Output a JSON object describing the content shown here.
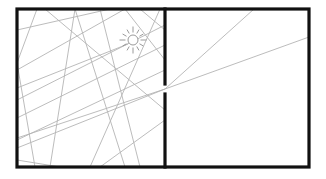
{
  "diagram": {
    "colors": {
      "wall": "#111111",
      "ray": "#b4b4b4",
      "sun": "#9a9a9a",
      "background": "#ffffff"
    },
    "frame": {
      "x1": 17,
      "y1": 9,
      "x2": 309,
      "y2": 167
    },
    "divider": {
      "x": 165,
      "top_segment_end_y": 84,
      "bottom_segment_start_y": 94
    },
    "light_source": {
      "icon": "sun-icon",
      "cx": 133,
      "cy": 40,
      "r": 5,
      "ray_inner": 7.5,
      "ray_outer": 12,
      "ray_count": 12
    },
    "rays_left_room": [
      {
        "x1": 37,
        "y1": 9,
        "x2": 17,
        "y2": 63
      },
      {
        "x1": 17,
        "y1": 63,
        "x2": 35,
        "y2": 167
      },
      {
        "x1": 75,
        "y1": 9,
        "x2": 50,
        "y2": 167
      },
      {
        "x1": 75,
        "y1": 9,
        "x2": 125,
        "y2": 167
      },
      {
        "x1": 17,
        "y1": 118,
        "x2": 165,
        "y2": 45
      },
      {
        "x1": 17,
        "y1": 140,
        "x2": 165,
        "y2": 70
      },
      {
        "x1": 17,
        "y1": 70,
        "x2": 125,
        "y2": 9
      },
      {
        "x1": 125,
        "y1": 9,
        "x2": 165,
        "y2": 60
      },
      {
        "x1": 17,
        "y1": 100,
        "x2": 165,
        "y2": 25
      },
      {
        "x1": 17,
        "y1": 160,
        "x2": 60,
        "y2": 167
      },
      {
        "x1": 110,
        "y1": 9,
        "x2": 17,
        "y2": 30
      },
      {
        "x1": 100,
        "y1": 9,
        "x2": 140,
        "y2": 167
      },
      {
        "x1": 160,
        "y1": 9,
        "x2": 90,
        "y2": 167
      },
      {
        "x1": 128,
        "y1": 44,
        "x2": 17,
        "y2": 88
      },
      {
        "x1": 140,
        "y1": 9,
        "x2": 165,
        "y2": 30
      },
      {
        "x1": 165,
        "y1": 120,
        "x2": 100,
        "y2": 167
      },
      {
        "x1": 45,
        "y1": 9,
        "x2": 165,
        "y2": 110
      }
    ],
    "rays_through_gap": [
      {
        "x1": 17,
        "y1": 148,
        "x2": 165,
        "y2": 89
      },
      {
        "x1": 165,
        "y1": 89,
        "x2": 254,
        "y2": 9
      },
      {
        "x1": 17,
        "y1": 138,
        "x2": 165,
        "y2": 89
      },
      {
        "x1": 165,
        "y1": 89,
        "x2": 309,
        "y2": 37
      }
    ]
  }
}
